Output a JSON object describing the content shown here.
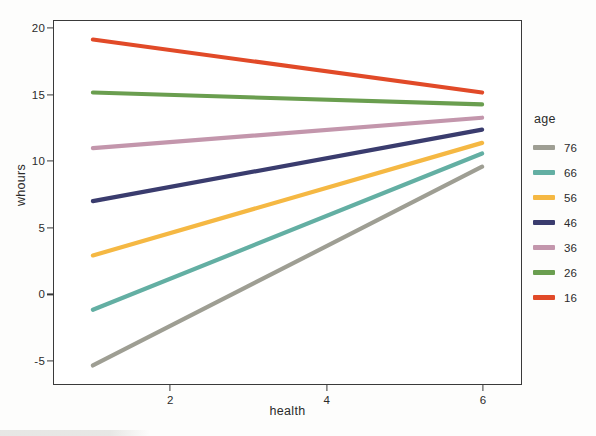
{
  "chart_data": {
    "type": "line",
    "title": "",
    "xlabel": "health",
    "ylabel": "whours",
    "xlim": [
      0.5,
      6.5
    ],
    "ylim": [
      -6.8,
      20.6
    ],
    "xticks": [
      "2",
      "4",
      "6"
    ],
    "xtick_values": [
      2,
      4,
      6
    ],
    "yticks": [
      "20",
      "15",
      "10",
      "5",
      "0",
      "-5"
    ],
    "ytick_values": [
      20,
      15,
      10,
      5,
      0,
      -5
    ],
    "grid": false,
    "legend": {
      "title": "age",
      "position": "right"
    },
    "x": [
      1,
      6
    ],
    "series": [
      {
        "name": "76",
        "values": [
          -5.4,
          9.6
        ],
        "color": "#9E9E93"
      },
      {
        "name": "66",
        "values": [
          -1.2,
          10.6
        ],
        "color": "#63AFA3"
      },
      {
        "name": "56",
        "values": [
          2.9,
          11.4
        ],
        "color": "#F5B843"
      },
      {
        "name": "46",
        "values": [
          7.0,
          12.4
        ],
        "color": "#3A3C6E"
      },
      {
        "name": "36",
        "values": [
          11.0,
          13.3
        ],
        "color": "#C396AC"
      },
      {
        "name": "26",
        "values": [
          15.2,
          14.3
        ],
        "color": "#6A9E4F"
      },
      {
        "name": "16",
        "values": [
          19.2,
          15.2
        ],
        "color": "#E14A28"
      }
    ]
  },
  "axes": {
    "y_title": "whours",
    "x_title": "health"
  },
  "legend": {
    "title": "age",
    "items": [
      {
        "label": "76",
        "color": "#9E9E93"
      },
      {
        "label": "66",
        "color": "#63AFA3"
      },
      {
        "label": "56",
        "color": "#F5B843"
      },
      {
        "label": "46",
        "color": "#3A3C6E"
      },
      {
        "label": "36",
        "color": "#C396AC"
      },
      {
        "label": "26",
        "color": "#6A9E4F"
      },
      {
        "label": "16",
        "color": "#E14A28"
      }
    ]
  },
  "colors": {
    "panel_border": "#3a3a3a",
    "text": "#2b2b2b",
    "background": "#ffffff"
  }
}
